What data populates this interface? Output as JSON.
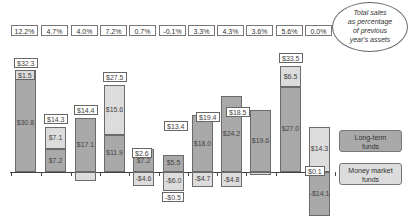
{
  "chart_data": {
    "type": "bar",
    "stacked": true,
    "title": "",
    "xlabel": "",
    "ylabel": "",
    "categories": [
      "1",
      "2",
      "3",
      "4",
      "5",
      "6",
      "7",
      "8",
      "9",
      "10",
      "11"
    ],
    "pct_labels": [
      "12.2%",
      "4.7%",
      "4.0%",
      "7.2%",
      "0.7%",
      "-0.1%",
      "3.3%",
      "4.3%",
      "3.6%",
      "5.6%",
      "0.0%"
    ],
    "totals": [
      "$32.3",
      "$14.3",
      "$14.4",
      "$27.5",
      "$2.6",
      "-$0.5",
      "$13.4",
      "$19.4",
      "$18.5",
      "$33.5",
      "$0.1"
    ],
    "series": [
      {
        "name": "Long-term funds",
        "color": "#a9a9a9",
        "values": [
          30.8,
          7.2,
          17.1,
          11.9,
          7.2,
          5.5,
          18.0,
          24.2,
          19.6,
          27.0,
          -14.1
        ],
        "labels": [
          "$30.8",
          "$7.2",
          "$17.1",
          "$11.9",
          "$7.2",
          "$5.5",
          "$18.0",
          "$24.2",
          "$19.6",
          "$27.0",
          "-$14.1"
        ]
      },
      {
        "name": "Money market funds",
        "color": "#dcdcdc",
        "values": [
          1.5,
          7.1,
          -2.7,
          15.6,
          -4.6,
          -6.0,
          -4.7,
          -4.8,
          -1.1,
          6.5,
          14.3
        ],
        "labels": [
          "$1.5",
          "$7.1",
          "-$2.7",
          "$15.6",
          "-$4.6",
          "-$6.0",
          "-$4.7",
          "-$4.8",
          "-$1.1",
          "$6.5",
          "$14.3"
        ]
      }
    ],
    "legend": {
      "position": "right",
      "entries": [
        "Long-term funds",
        "Money market funds"
      ]
    },
    "annotation": "Total sales as percentage of previous year's assets",
    "grid": false
  },
  "legend": {
    "long_term": "Long-term funds",
    "money_market": "Money market funds"
  },
  "annotation": {
    "line1": "Total sales",
    "line2": "as percentage",
    "line3": "of previous",
    "line4": "year's assets"
  }
}
